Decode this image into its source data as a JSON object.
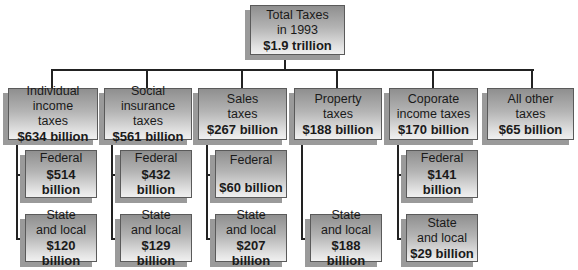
{
  "root": {
    "label_line1": "Total Taxes",
    "label_line2": "in 1993",
    "value": "$1.9 trillion"
  },
  "categories": [
    {
      "label_line1": "Individual income",
      "label_line2": "taxes",
      "value": "$634 billion",
      "children": [
        {
          "label_line1": "Federal",
          "label_line2": "",
          "value": "$514 billion"
        },
        {
          "label_line1": "State",
          "label_line2": "and local",
          "value": "$120 billion"
        }
      ]
    },
    {
      "label_line1": "Social insurance",
      "label_line2": "taxes",
      "value": "$561 billion",
      "children": [
        {
          "label_line1": "Federal",
          "label_line2": "",
          "value": "$432 billion"
        },
        {
          "label_line1": "State",
          "label_line2": "and local",
          "value": "$129 billion"
        }
      ]
    },
    {
      "label_line1": "Sales",
      "label_line2": "taxes",
      "value": "$267 billion",
      "children": [
        {
          "label_line1": "Federal",
          "label_line2": "",
          "value": "$60 billion"
        },
        {
          "label_line1": "State",
          "label_line2": "and local",
          "value": "$207 billion"
        }
      ]
    },
    {
      "label_line1": "Property",
      "label_line2": "taxes",
      "value": "$188 billion",
      "children": [
        {
          "label_line1": "State",
          "label_line2": "and local",
          "value": "$188 billion"
        }
      ]
    },
    {
      "label_line1": "Coporate",
      "label_line2": "income taxes",
      "value": "$170 billion",
      "children": [
        {
          "label_line1": "Federal",
          "label_line2": "",
          "value": "$141 billion"
        },
        {
          "label_line1": "State",
          "label_line2": "and local",
          "value": "$29 billion"
        }
      ]
    },
    {
      "label_line1": "All other",
      "label_line2": "taxes",
      "value": "$65 billion",
      "children": []
    }
  ],
  "colors": {
    "box_gradient_top": "#8f8f8f",
    "box_gradient_bottom": "#f0f0f0",
    "box_shadow": "#9a9a9a",
    "line": "#222222"
  }
}
